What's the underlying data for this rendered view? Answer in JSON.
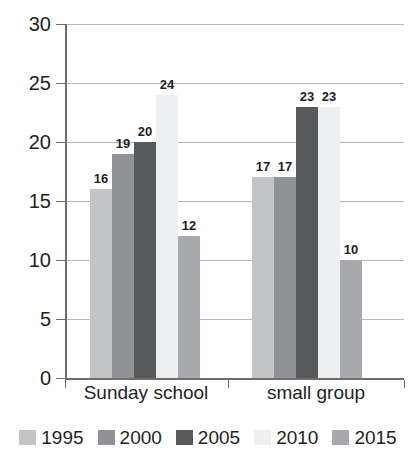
{
  "chart_data": {
    "type": "bar",
    "title": "",
    "xlabel": "",
    "ylabel": "",
    "ylim": [
      0,
      30
    ],
    "yticks": [
      "0",
      "5",
      "10",
      "15",
      "20",
      "25",
      "30"
    ],
    "grid": true,
    "legend_position": "bottom",
    "categories": [
      "Sunday school",
      "small group"
    ],
    "series": [
      {
        "name": "1995",
        "color": "#c3c4c6",
        "values": [
          16,
          17
        ]
      },
      {
        "name": "2000",
        "color": "#919295",
        "values": [
          19,
          17
        ]
      },
      {
        "name": "2005",
        "color": "#58595b",
        "values": [
          20,
          23
        ]
      },
      {
        "name": "2010",
        "color": "#eeeff0",
        "values": [
          24,
          23
        ]
      },
      {
        "name": "2015",
        "color": "#a7a9ac",
        "values": [
          12,
          10
        ]
      }
    ],
    "bar_labels": {
      "Sunday school": [
        "16",
        "19",
        "20",
        "24",
        "12"
      ],
      "small group": [
        "17",
        "17",
        "23",
        "23",
        "10"
      ]
    }
  },
  "axis": {
    "y_ticks": [
      "30",
      "25",
      "20",
      "15",
      "10",
      "5",
      "0"
    ]
  },
  "category_labels": [
    "Sunday school",
    "small group"
  ],
  "legend": {
    "entries": [
      {
        "label": "1995",
        "color": "#c3c4c6"
      },
      {
        "label": "2000",
        "color": "#919295"
      },
      {
        "label": "2005",
        "color": "#58595b"
      },
      {
        "label": "2010",
        "color": "#eeeff0"
      },
      {
        "label": "2015",
        "color": "#a7a9ac"
      }
    ]
  },
  "colors": {
    "axis": "#6d6e71",
    "grid": "#b7b8ba",
    "text": "#231f20",
    "background": "#ffffff"
  }
}
